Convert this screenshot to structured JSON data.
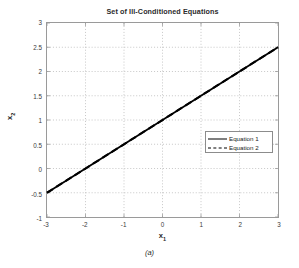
{
  "chart_data": {
    "type": "line",
    "title": "Set of Ill-Conditioned Equations",
    "xlabel": "x1",
    "ylabel": "x2",
    "xlabel_base": "x",
    "xlabel_sub": "1",
    "ylabel_base": "x",
    "ylabel_sub": "2",
    "xlim": [
      -3,
      3
    ],
    "ylim": [
      -1,
      3
    ],
    "xticks": [
      -3,
      -2,
      -1,
      0,
      1,
      2,
      3
    ],
    "xtick_labels": [
      "-3",
      "-2",
      "-1",
      "0",
      "1",
      "2",
      "3"
    ],
    "yticks": [
      -1,
      -0.5,
      0,
      0.5,
      1,
      1.5,
      2,
      2.5,
      3
    ],
    "ytick_labels": [
      "-1",
      "-0.5",
      "0",
      "0.5",
      "1",
      "1.5",
      "2",
      "2.5",
      "3"
    ],
    "grid": true,
    "grid_style": "dotted",
    "legend_position": "center-right",
    "series": [
      {
        "name": "Equation 1",
        "style": "solid",
        "color": "#000000",
        "x": [
          -3,
          3
        ],
        "y": [
          -0.5,
          2.5
        ]
      },
      {
        "name": "Equation 2",
        "style": "dashed",
        "color": "#000000",
        "x": [
          -3,
          3
        ],
        "y": [
          -0.5,
          2.5
        ]
      }
    ]
  },
  "caption": "(a)",
  "colors": {
    "axis": "#9a9a9a",
    "grid": "#b8b8b8",
    "line": "#000000",
    "text": "#2b2b2b"
  }
}
